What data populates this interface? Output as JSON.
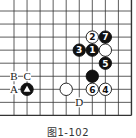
{
  "figure": {
    "caption": "图1-102",
    "board": {
      "grid": {
        "cols": 10,
        "rows": 9,
        "x0": 14,
        "y0": 11,
        "spacing": 13.05,
        "line_color": "#333333"
      },
      "edges": {
        "right": true,
        "bottom": true,
        "top": false,
        "left": false
      }
    },
    "stones": [
      {
        "color": "white",
        "col": 6,
        "row": 2,
        "label": "2"
      },
      {
        "color": "black",
        "col": 7,
        "row": 2,
        "label": "7"
      },
      {
        "color": "black",
        "col": 5,
        "row": 3,
        "label": "3"
      },
      {
        "color": "black",
        "col": 6,
        "row": 3,
        "label": "1"
      },
      {
        "color": "white",
        "col": 7,
        "row": 3,
        "label": ""
      },
      {
        "color": "black",
        "col": 7,
        "row": 4,
        "label": "5"
      },
      {
        "color": "black",
        "col": 6,
        "row": 5,
        "label": ""
      },
      {
        "color": "white",
        "col": 6,
        "row": 6,
        "label": "6"
      },
      {
        "color": "white",
        "col": 7,
        "row": 6,
        "label": "4"
      },
      {
        "color": "white",
        "col": 4,
        "row": 6,
        "label": ""
      },
      {
        "color": "black",
        "col": 1,
        "row": 6,
        "label": "",
        "marker": "triangle"
      }
    ],
    "letters": [
      {
        "text": "B",
        "col": 0,
        "row": 5
      },
      {
        "text": "C",
        "col": 1,
        "row": 5
      },
      {
        "text": "A",
        "col": 0,
        "row": 6
      },
      {
        "text": "D",
        "col": 5,
        "row": 7
      }
    ]
  }
}
